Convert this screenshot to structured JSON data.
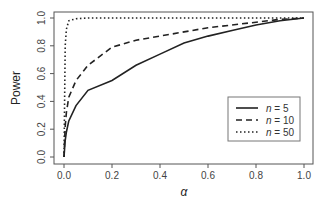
{
  "chart_data": {
    "type": "line",
    "title": "",
    "xlabel": "α",
    "ylabel": "Power",
    "xlim": [
      0,
      1
    ],
    "ylim": [
      0,
      1
    ],
    "x_ticks": [
      "0.0",
      "0.2",
      "0.4",
      "0.6",
      "0.8",
      "1.0"
    ],
    "y_ticks": [
      "0.0",
      "0.2",
      "0.4",
      "0.6",
      "0.8",
      "1.0"
    ],
    "grid": false,
    "legend_position": "center-right",
    "x": [
      0,
      0.005,
      0.01,
      0.02,
      0.05,
      0.1,
      0.2,
      0.3,
      0.4,
      0.5,
      0.6,
      0.7,
      0.8,
      0.9,
      1.0
    ],
    "series": [
      {
        "name": "n = 5",
        "n_label": "n",
        "n_value": "= 5",
        "linestyle": "solid",
        "values": [
          0,
          0.12,
          0.18,
          0.26,
          0.37,
          0.48,
          0.55,
          0.66,
          0.74,
          0.82,
          0.87,
          0.91,
          0.95,
          0.98,
          1.0
        ]
      },
      {
        "name": "n = 10",
        "n_label": "n",
        "n_value": "= 10",
        "linestyle": "dashed",
        "values": [
          0,
          0.22,
          0.32,
          0.43,
          0.55,
          0.66,
          0.79,
          0.84,
          0.87,
          0.9,
          0.93,
          0.95,
          0.97,
          0.99,
          1.0
        ]
      },
      {
        "name": "n = 50",
        "n_label": "n",
        "n_value": "= 50",
        "linestyle": "dotted",
        "values": [
          0,
          0.8,
          0.92,
          0.98,
          0.995,
          1.0,
          1.0,
          1.0,
          1.0,
          1.0,
          1.0,
          1.0,
          1.0,
          1.0,
          1.0
        ]
      }
    ]
  }
}
